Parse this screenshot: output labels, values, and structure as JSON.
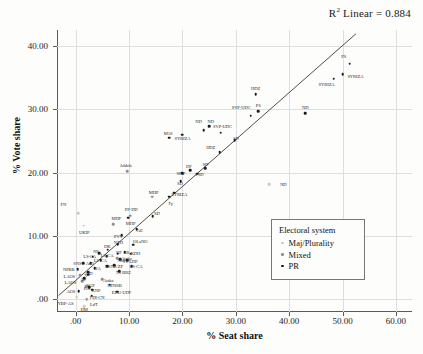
{
  "annotation": {
    "r2_text_prefix": "R",
    "r2_text_sup": "2",
    "r2_text_rest": " Linear = 0.884"
  },
  "legend": {
    "title": "Electoral system",
    "entries": [
      {
        "label": "Maj/Plurality",
        "color": "#c9c9c9",
        "key": "maj"
      },
      {
        "label": "Mixed",
        "color": "#8f8f8f",
        "key": "mixed"
      },
      {
        "label": "PR",
        "color": "#1a1a1a",
        "key": "pr"
      }
    ]
  },
  "chart_data": {
    "type": "scatter",
    "title": "",
    "xlabel": "% Seat share",
    "ylabel": "% Vote share",
    "xlim": [
      -3.5,
      63.0
    ],
    "ylim": [
      -2.0,
      42.5
    ],
    "xticks": [
      0,
      10,
      20,
      30,
      40,
      50,
      60
    ],
    "xticklabels": [
      ".00",
      "10.00",
      "20.00",
      "30.00",
      "40.00",
      "50.00",
      "60.00"
    ],
    "yticks": [
      0,
      10,
      20,
      30,
      40
    ],
    "yticklabels": [
      ".00",
      "10.00",
      "20.00",
      "30.00",
      "40.00"
    ],
    "grid": true,
    "legend_position": "inside-lower-right",
    "annotations": [
      {
        "text": "R2 Linear = 0.884",
        "position": "top-right"
      }
    ],
    "trendline": {
      "type": "linear",
      "r_squared": 0.884,
      "x_start": -3.2,
      "y_start": 0.6,
      "x_end": 52.5,
      "y_end": 41.9
    },
    "series": [
      {
        "name": "Maj/Plurality",
        "color": "#c9c9c9",
        "points": [
          {
            "label": "FN",
            "x": 0.5,
            "y": 13.6,
            "lx": -2.3,
            "ly": 15.1
          },
          {
            "label": "UKIP",
            "x": 1.5,
            "y": 11.6,
            "lx": 1.6,
            "ly": 10.7
          },
          {
            "label": "ND",
            "x": 36.2,
            "y": 18.2,
            "lx": 38.9,
            "ly": 18.2
          },
          {
            "label": "YBP-AS",
            "x": 0.2,
            "y": 0.3,
            "lx": -1.9,
            "ly": -0.6
          },
          {
            "label": "HM",
            "x": 1.6,
            "y": -1.1,
            "lx": 1.6,
            "ly": -1.6
          }
        ]
      },
      {
        "name": "Mixed",
        "color": "#8f8f8f",
        "points": [
          {
            "label": "Jobbik",
            "x": 9.6,
            "y": 20.2,
            "lx": 9.4,
            "ly": 21.2
          },
          {
            "label": "MHP",
            "x": 7.0,
            "y": 11.9,
            "lx": 7.6,
            "ly": 12.8
          },
          {
            "label": "PP-DD",
            "x": 10.2,
            "y": 13.2,
            "lx": 10.4,
            "ly": 14.3
          },
          {
            "label": "MHP",
            "x": 14.3,
            "y": 16.2,
            "lx": 14.6,
            "ly": 16.9
          },
          {
            "label": "LAOS",
            "x": 0.9,
            "y": 3.8,
            "lx": -1.2,
            "ly": 3.7
          },
          {
            "label": "LAOS",
            "x": 1.2,
            "y": 2.9,
            "lx": -1.0,
            "ly": 2.7
          },
          {
            "label": "Ataka",
            "x": 5.0,
            "y": 3.2,
            "lx": 6.1,
            "ly": 3.0
          },
          {
            "label": "Ataka",
            "x": 7.8,
            "y": 6.5,
            "lx": 9.5,
            "ly": 6.6
          },
          {
            "label": "SGP",
            "x": 2.0,
            "y": 2.1,
            "lx": 2.8,
            "ly": 2.2
          },
          {
            "label": "LdT",
            "x": 2.1,
            "y": 0.0,
            "lx": 3.4,
            "ly": -0.7
          }
        ]
      },
      {
        "name": "PR",
        "color": "#1a1a1a",
        "points": [
          {
            "label": "PS",
            "x": 51.3,
            "y": 37.2,
            "lx": 50.2,
            "ly": 38.4
          },
          {
            "label": "SYRIZA",
            "x": 50.0,
            "y": 35.5,
            "lx": 52.4,
            "ly": 35.3
          },
          {
            "label": "SYRIZA",
            "x": 48.3,
            "y": 34.8,
            "lx": 47.0,
            "ly": 33.9
          },
          {
            "label": "HDZ",
            "x": 33.7,
            "y": 32.4,
            "lx": 33.7,
            "ly": 33.4
          },
          {
            "label": "ND",
            "x": 43.0,
            "y": 29.4,
            "lx": 43.0,
            "ly": 30.3
          },
          {
            "label": "PS",
            "x": 34.2,
            "y": 29.7,
            "lx": 34.2,
            "ly": 30.6
          },
          {
            "label": "SVP-UDC",
            "x": 32.8,
            "y": 29.0,
            "lx": 31.0,
            "ly": 30.4
          },
          {
            "label": "ND",
            "x": 24.0,
            "y": 26.7,
            "lx": 23.0,
            "ly": 28.1
          },
          {
            "label": "ND",
            "x": 25.0,
            "y": 27.3,
            "lx": 25.3,
            "ly": 28.2
          },
          {
            "label": "SVP-UDC",
            "x": 27.2,
            "y": 26.3,
            "lx": 27.5,
            "ly": 27.4
          },
          {
            "label": "M5S",
            "x": 17.5,
            "y": 25.5,
            "lx": 17.3,
            "ly": 26.3
          },
          {
            "label": "SYRIZA",
            "x": 20.0,
            "y": 26.0,
            "lx": 20.0,
            "ly": 25.5
          },
          {
            "label": "SD",
            "x": 29.8,
            "y": 25.1,
            "lx": 30.0,
            "ly": 25.4
          },
          {
            "label": "HDZ",
            "x": 27.0,
            "y": 23.2,
            "lx": 25.3,
            "ly": 24.0
          },
          {
            "label": "SD",
            "x": 24.3,
            "y": 20.7,
            "lx": 24.3,
            "ly": 21.4
          },
          {
            "label": "DF",
            "x": 21.5,
            "y": 20.4,
            "lx": 21.2,
            "ly": 21.1
          },
          {
            "label": "PSD",
            "x": 22.8,
            "y": 19.8,
            "lx": 23.2,
            "ly": 19.7
          },
          {
            "label": "SP-P",
            "x": 20.0,
            "y": 19.9,
            "lx": 19.7,
            "ly": 19.9
          },
          {
            "label": "SD",
            "x": 19.7,
            "y": 18.6,
            "lx": 19.5,
            "ly": 18.4
          },
          {
            "label": "SYRIZA",
            "x": 18.5,
            "y": 16.8,
            "lx": 19.4,
            "ly": 16.6
          },
          {
            "label": "Fy",
            "x": 17.5,
            "y": 16.2,
            "lx": 17.8,
            "ly": 15.2
          },
          {
            "label": "SD",
            "x": 14.4,
            "y": 13.1,
            "lx": 15.2,
            "ly": 13.7
          },
          {
            "label": "MHP",
            "x": 9.8,
            "y": 12.9,
            "lx": 10.3,
            "ly": 12.0
          },
          {
            "label": "AE",
            "x": 11.4,
            "y": 11.1,
            "lx": 12.0,
            "ly": 10.9
          },
          {
            "label": "PVV",
            "x": 8.6,
            "y": 10.1,
            "lx": 8.0,
            "ly": 10.0
          },
          {
            "label": "OLaNO",
            "x": 10.8,
            "y": 8.6,
            "lx": 12.1,
            "ly": 9.2
          },
          {
            "label": "NZH",
            "x": 7.9,
            "y": 8.7,
            "lx": 8.0,
            "ly": 9.1
          },
          {
            "label": "DK",
            "x": 6.0,
            "y": 7.8,
            "lx": 5.9,
            "ly": 8.4
          },
          {
            "label": "KDH",
            "x": 10.3,
            "y": 7.2,
            "lx": 11.2,
            "ly": 7.3
          },
          {
            "label": "NF",
            "x": 7.9,
            "y": 7.2,
            "lx": 8.1,
            "ly": 7.5
          },
          {
            "label": "SB",
            "x": 9.2,
            "y": 7.4,
            "lx": 9.5,
            "ly": 7.5
          },
          {
            "label": "NS",
            "x": 4.4,
            "y": 7.3,
            "lx": 3.8,
            "ly": 7.6
          },
          {
            "label": "LS-CA",
            "x": 5.8,
            "y": 6.8,
            "lx": 5.9,
            "ly": 7.0
          },
          {
            "label": "LS-CA",
            "x": 3.2,
            "y": 6.7,
            "lx": 2.6,
            "ly": 6.9
          },
          {
            "label": "LS-CA",
            "x": 4.7,
            "y": 6.2,
            "lx": 4.6,
            "ly": 6.2
          },
          {
            "label": "NoL",
            "x": 8.3,
            "y": 6.3,
            "lx": 8.6,
            "ly": 6.2
          },
          {
            "label": "TT-LDP",
            "x": 9.6,
            "y": 6.2,
            "lx": 10.2,
            "ly": 6.1
          },
          {
            "label": "SNS",
            "x": 1.4,
            "y": 5.7,
            "lx": 0.3,
            "ly": 5.7
          },
          {
            "label": "AfD",
            "x": 2.8,
            "y": 5.7,
            "lx": 2.6,
            "ly": 5.7
          },
          {
            "label": "LS-CA",
            "x": 10.5,
            "y": 5.2,
            "lx": 11.3,
            "ly": 5.2
          },
          {
            "label": "NZ/ZP",
            "x": 7.2,
            "y": 5.4,
            "lx": 7.7,
            "ly": 5.3
          },
          {
            "label": "NPBB",
            "x": 0.4,
            "y": 4.8,
            "lx": -1.3,
            "ly": 4.8
          },
          {
            "label": "NS",
            "x": 5.9,
            "y": 5.2,
            "lx": 6.0,
            "ly": 5.2
          },
          {
            "label": "NA",
            "x": 3.6,
            "y": 4.9,
            "lx": 4.1,
            "ly": 4.9
          },
          {
            "label": "AfD",
            "x": 2.3,
            "y": 4.3,
            "lx": 2.4,
            "ly": 4.2
          },
          {
            "label": "TS BBZ",
            "x": 8.1,
            "y": 4.4,
            "lx": 8.9,
            "ly": 4.3
          },
          {
            "label": "HDSSB",
            "x": 6.4,
            "y": 2.3,
            "lx": 7.3,
            "ly": 2.2
          },
          {
            "label": "KNP",
            "x": 3.1,
            "y": 1.5,
            "lx": 3.8,
            "ly": 1.4
          },
          {
            "label": "EDU-UDF",
            "x": 7.8,
            "y": 1.2,
            "lx": 8.6,
            "ly": 1.1
          },
          {
            "label": "FDI-CN",
            "x": 3.0,
            "y": 0.6,
            "lx": 4.0,
            "ly": 0.4
          },
          {
            "label": "AOS",
            "x": 0.6,
            "y": 1.3,
            "lx": -0.9,
            "ly": 1.3
          },
          {
            "label": "PiS",
            "x": 2.5,
            "y": 1.9,
            "lx": 2.1,
            "ly": 1.8
          },
          {
            "label": "SP",
            "x": 1.6,
            "y": 3.3,
            "lx": 1.5,
            "ly": 3.2
          },
          {
            "label": "V",
            "x": 2.4,
            "y": 3.9,
            "lx": 2.0,
            "ly": 3.9
          }
        ]
      }
    ]
  }
}
